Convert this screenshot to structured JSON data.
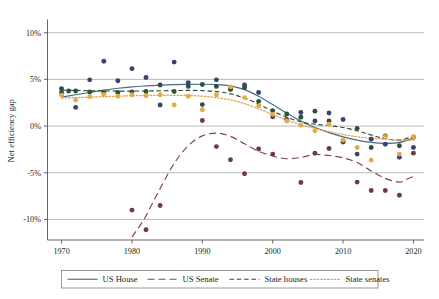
{
  "chart_data": {
    "type": "scatter",
    "title": "",
    "xlabel": "",
    "ylabel": "Net efficiency gap",
    "xlim": [
      1968,
      2021.5
    ],
    "ylim": [
      -12.2,
      11.2
    ],
    "xticks": [
      1970,
      1980,
      1990,
      2000,
      2010,
      2020
    ],
    "xticklabels": [
      "1970",
      "1980",
      "1990",
      "2000",
      "2010",
      "2020"
    ],
    "yticks": [
      10,
      5,
      0,
      -5,
      -10
    ],
    "yticklabels": [
      "10%",
      "5%",
      "0%",
      "-5%",
      "-10%"
    ],
    "grid": "horizontal",
    "legend_position": "bottom",
    "series": [
      {
        "name": "US House",
        "color": "#4a6b8a",
        "linestyle": "solid",
        "point_color": "#36456b",
        "trend": [
          {
            "x": 1970,
            "y": 3.1
          },
          {
            "x": 1972,
            "y": 3.35
          },
          {
            "x": 1974,
            "y": 3.6
          },
          {
            "x": 1976,
            "y": 3.85
          },
          {
            "x": 1978,
            "y": 4.05
          },
          {
            "x": 1980,
            "y": 4.2
          },
          {
            "x": 1982,
            "y": 4.3
          },
          {
            "x": 1984,
            "y": 4.38
          },
          {
            "x": 1986,
            "y": 4.44
          },
          {
            "x": 1988,
            "y": 4.47
          },
          {
            "x": 1990,
            "y": 4.48
          },
          {
            "x": 1992,
            "y": 4.45
          },
          {
            "x": 1994,
            "y": 4.3
          },
          {
            "x": 1996,
            "y": 3.9
          },
          {
            "x": 1998,
            "y": 3.2
          },
          {
            "x": 2000,
            "y": 2.3
          },
          {
            "x": 2002,
            "y": 1.4
          },
          {
            "x": 2004,
            "y": 0.55
          },
          {
            "x": 2006,
            "y": -0.15
          },
          {
            "x": 2008,
            "y": -0.7
          },
          {
            "x": 2010,
            "y": -1.15
          },
          {
            "x": 2012,
            "y": -1.5
          },
          {
            "x": 2014,
            "y": -1.75
          },
          {
            "x": 2016,
            "y": -1.85
          },
          {
            "x": 2018,
            "y": -1.75
          },
          {
            "x": 2020,
            "y": -1.3
          }
        ],
        "points": [
          {
            "x": 1970,
            "y": 3.6
          },
          {
            "x": 1972,
            "y": 2.0
          },
          {
            "x": 1974,
            "y": 4.95
          },
          {
            "x": 1976,
            "y": 6.95
          },
          {
            "x": 1978,
            "y": 4.85
          },
          {
            "x": 1980,
            "y": 6.15
          },
          {
            "x": 1982,
            "y": 5.2
          },
          {
            "x": 1984,
            "y": 2.25
          },
          {
            "x": 1986,
            "y": 6.85
          },
          {
            "x": 1988,
            "y": 4.65
          },
          {
            "x": 1990,
            "y": 2.3
          },
          {
            "x": 1992,
            "y": 4.95
          },
          {
            "x": 1994,
            "y": 3.95
          },
          {
            "x": 1996,
            "y": 4.4
          },
          {
            "x": 1998,
            "y": 3.6
          },
          {
            "x": 2000,
            "y": 1.0
          },
          {
            "x": 2002,
            "y": 0.7
          },
          {
            "x": 2004,
            "y": 1.45
          },
          {
            "x": 2006,
            "y": 0.55
          },
          {
            "x": 2008,
            "y": 1.4
          },
          {
            "x": 2010,
            "y": 0.7
          },
          {
            "x": 2012,
            "y": -3.0
          },
          {
            "x": 2014,
            "y": -1.4
          },
          {
            "x": 2016,
            "y": -1.95
          },
          {
            "x": 2018,
            "y": -3.35
          },
          {
            "x": 2020,
            "y": -2.3
          }
        ]
      },
      {
        "name": "US Senate",
        "color": "#7e4453",
        "linestyle": "longdash",
        "point_color": "#6e3a44",
        "trend": [
          {
            "x": 1980,
            "y": -11.9
          },
          {
            "x": 1981,
            "y": -10.8
          },
          {
            "x": 1982,
            "y": -9.6
          },
          {
            "x": 1984,
            "y": -6.7
          },
          {
            "x": 1986,
            "y": -4.0
          },
          {
            "x": 1988,
            "y": -2.1
          },
          {
            "x": 1990,
            "y": -1.05
          },
          {
            "x": 1992,
            "y": -0.75
          },
          {
            "x": 1994,
            "y": -1.1
          },
          {
            "x": 1996,
            "y": -1.9
          },
          {
            "x": 1998,
            "y": -2.7
          },
          {
            "x": 2000,
            "y": -3.2
          },
          {
            "x": 2002,
            "y": -3.5
          },
          {
            "x": 2004,
            "y": -3.35
          },
          {
            "x": 2006,
            "y": -3.05
          },
          {
            "x": 2008,
            "y": -3.15
          },
          {
            "x": 2010,
            "y": -3.4
          },
          {
            "x": 2012,
            "y": -3.9
          },
          {
            "x": 2014,
            "y": -4.8
          },
          {
            "x": 2016,
            "y": -5.6
          },
          {
            "x": 2018,
            "y": -6.0
          },
          {
            "x": 2019,
            "y": -5.7
          },
          {
            "x": 2020,
            "y": -5.4
          }
        ],
        "points": [
          {
            "x": 1980,
            "y": -9.0
          },
          {
            "x": 1982,
            "y": -11.1
          },
          {
            "x": 1984,
            "y": -8.5
          },
          {
            "x": 1990,
            "y": 0.6
          },
          {
            "x": 1992,
            "y": -2.2
          },
          {
            "x": 1994,
            "y": -3.6
          },
          {
            "x": 1996,
            "y": -5.1
          },
          {
            "x": 1998,
            "y": -2.45
          },
          {
            "x": 2000,
            "y": -3.0
          },
          {
            "x": 2004,
            "y": -6.05
          },
          {
            "x": 2006,
            "y": -2.9
          },
          {
            "x": 2008,
            "y": -2.4
          },
          {
            "x": 2010,
            "y": -1.6
          },
          {
            "x": 2012,
            "y": -6.0
          },
          {
            "x": 2014,
            "y": -6.9
          },
          {
            "x": 2016,
            "y": -6.9
          },
          {
            "x": 2018,
            "y": -7.4
          },
          {
            "x": 2020,
            "y": -2.9
          }
        ]
      },
      {
        "name": "State houses",
        "color": "#2c4a33",
        "linestyle": "dash",
        "point_color": "#2e5238",
        "trend": [
          {
            "x": 1970,
            "y": 3.85
          },
          {
            "x": 1972,
            "y": 3.82
          },
          {
            "x": 1974,
            "y": 3.78
          },
          {
            "x": 1976,
            "y": 3.76
          },
          {
            "x": 1978,
            "y": 3.75
          },
          {
            "x": 1980,
            "y": 3.75
          },
          {
            "x": 1982,
            "y": 3.76
          },
          {
            "x": 1984,
            "y": 3.78
          },
          {
            "x": 1986,
            "y": 3.8
          },
          {
            "x": 1988,
            "y": 3.82
          },
          {
            "x": 1990,
            "y": 3.8
          },
          {
            "x": 1992,
            "y": 3.7
          },
          {
            "x": 1994,
            "y": 3.45
          },
          {
            "x": 1996,
            "y": 3.0
          },
          {
            "x": 1998,
            "y": 2.35
          },
          {
            "x": 2000,
            "y": 1.6
          },
          {
            "x": 2002,
            "y": 0.95
          },
          {
            "x": 2004,
            "y": 0.45
          },
          {
            "x": 2006,
            "y": 0.2
          },
          {
            "x": 2008,
            "y": 0.05
          },
          {
            "x": 2010,
            "y": -0.15
          },
          {
            "x": 2012,
            "y": -0.5
          },
          {
            "x": 2014,
            "y": -0.95
          },
          {
            "x": 2016,
            "y": -1.35
          },
          {
            "x": 2018,
            "y": -1.5
          },
          {
            "x": 2020,
            "y": -1.1
          }
        ],
        "points": [
          {
            "x": 1970,
            "y": 4.0
          },
          {
            "x": 1971,
            "y": 3.75
          },
          {
            "x": 1972,
            "y": 3.75
          },
          {
            "x": 1974,
            "y": 3.65
          },
          {
            "x": 1976,
            "y": 3.6
          },
          {
            "x": 1978,
            "y": 3.6
          },
          {
            "x": 1980,
            "y": 3.65
          },
          {
            "x": 1982,
            "y": 3.7
          },
          {
            "x": 1984,
            "y": 4.4
          },
          {
            "x": 1986,
            "y": 3.7
          },
          {
            "x": 1988,
            "y": 4.25
          },
          {
            "x": 1990,
            "y": 4.45
          },
          {
            "x": 1992,
            "y": 4.25
          },
          {
            "x": 1994,
            "y": 3.95
          },
          {
            "x": 1996,
            "y": 4.1
          },
          {
            "x": 1998,
            "y": 2.65
          },
          {
            "x": 2000,
            "y": 1.65
          },
          {
            "x": 2002,
            "y": 1.3
          },
          {
            "x": 2004,
            "y": 0.95
          },
          {
            "x": 2006,
            "y": 1.6
          },
          {
            "x": 2008,
            "y": 0.55
          },
          {
            "x": 2010,
            "y": -1.7
          },
          {
            "x": 2012,
            "y": -0.25
          },
          {
            "x": 2014,
            "y": -2.3
          },
          {
            "x": 2016,
            "y": -1.05
          },
          {
            "x": 2018,
            "y": -2.1
          },
          {
            "x": 2020,
            "y": -1.2
          }
        ]
      },
      {
        "name": "State senates",
        "color": "#e0a043",
        "linestyle": "dot",
        "point_color": "#e8a945",
        "trend": [
          {
            "x": 1970,
            "y": 3.0
          },
          {
            "x": 1972,
            "y": 3.05
          },
          {
            "x": 1974,
            "y": 3.1
          },
          {
            "x": 1976,
            "y": 3.15
          },
          {
            "x": 1978,
            "y": 3.2
          },
          {
            "x": 1980,
            "y": 3.25
          },
          {
            "x": 1982,
            "y": 3.28
          },
          {
            "x": 1984,
            "y": 3.3
          },
          {
            "x": 1986,
            "y": 3.3
          },
          {
            "x": 1988,
            "y": 3.28
          },
          {
            "x": 1990,
            "y": 3.2
          },
          {
            "x": 1992,
            "y": 3.05
          },
          {
            "x": 1994,
            "y": 2.8
          },
          {
            "x": 1996,
            "y": 2.4
          },
          {
            "x": 1998,
            "y": 1.85
          },
          {
            "x": 2000,
            "y": 1.25
          },
          {
            "x": 2002,
            "y": 0.65
          },
          {
            "x": 2004,
            "y": 0.15
          },
          {
            "x": 2006,
            "y": -0.25
          },
          {
            "x": 2008,
            "y": -0.6
          },
          {
            "x": 2010,
            "y": -0.9
          },
          {
            "x": 2012,
            "y": -1.15
          },
          {
            "x": 2014,
            "y": -1.3
          },
          {
            "x": 2016,
            "y": -1.4
          },
          {
            "x": 2018,
            "y": -1.5
          },
          {
            "x": 2020,
            "y": -1.5
          }
        ],
        "points": [
          {
            "x": 1970,
            "y": 3.3
          },
          {
            "x": 1972,
            "y": 2.8
          },
          {
            "x": 1974,
            "y": 3.15
          },
          {
            "x": 1976,
            "y": 3.4
          },
          {
            "x": 1978,
            "y": 3.2
          },
          {
            "x": 1980,
            "y": 3.35
          },
          {
            "x": 1982,
            "y": 3.25
          },
          {
            "x": 1984,
            "y": 3.35
          },
          {
            "x": 1986,
            "y": 2.25
          },
          {
            "x": 1988,
            "y": 3.2
          },
          {
            "x": 1990,
            "y": 1.75
          },
          {
            "x": 1992,
            "y": 3.35
          },
          {
            "x": 1994,
            "y": 4.2
          },
          {
            "x": 1996,
            "y": 3.05
          },
          {
            "x": 1998,
            "y": 2.15
          },
          {
            "x": 2000,
            "y": 1.25
          },
          {
            "x": 2002,
            "y": 0.55
          },
          {
            "x": 2004,
            "y": 0.1
          },
          {
            "x": 2006,
            "y": -0.5
          },
          {
            "x": 2008,
            "y": 0.2
          },
          {
            "x": 2010,
            "y": -1.5
          },
          {
            "x": 2012,
            "y": -2.3
          },
          {
            "x": 2014,
            "y": -3.65
          },
          {
            "x": 2016,
            "y": -1.15
          },
          {
            "x": 2018,
            "y": -3.0
          },
          {
            "x": 2020,
            "y": -1.15
          }
        ]
      }
    ]
  },
  "legend": {
    "items": [
      {
        "label": "US House",
        "style": "solid",
        "color": "#4a6b8a"
      },
      {
        "label": "US Senate",
        "style": "longdash",
        "color": "#7e4453"
      },
      {
        "label": "State houses",
        "style": "dash",
        "color": "#2c4a33"
      },
      {
        "label": "State senates",
        "style": "dot",
        "color": "#e0a043"
      }
    ]
  },
  "axes": {
    "y_title": "Net efficiency gap"
  }
}
